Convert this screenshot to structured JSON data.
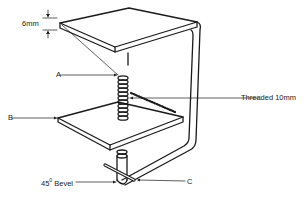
{
  "diagram": {
    "line_color": "#1a1a1a",
    "background": "#ffffff",
    "labels": {
      "thickness": "6mm",
      "a": "A",
      "b": "B",
      "c": "C",
      "threaded": "Threaded  10mm",
      "bevel_num": "45",
      "bevel_deg": "0",
      "bevel_word": "Bevel"
    }
  }
}
